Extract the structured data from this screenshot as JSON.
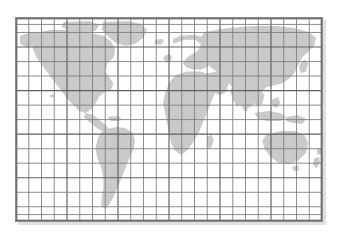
{
  "figure": {
    "kind": "world-map",
    "projection_label": "equirectangular",
    "background_color": "#ffffff",
    "land_color": "#c9cacb",
    "graticule_color": "#7d7f81",
    "graticule_major_color": "#5d5f61",
    "frame_color": "#6f7173",
    "shadow_color": "#c9c9c9",
    "frame": {
      "x": 15,
      "y": 17,
      "width": 308,
      "height": 205
    },
    "graticule": {
      "columns": 24,
      "rows": 14,
      "meridian_spacing_degrees": 15,
      "parallel_spacing_degrees": 15,
      "major_every_columns": 4,
      "major_every_rows": 3,
      "show_grid": true
    },
    "extent": {
      "west_degrees": -180,
      "east_degrees": 180,
      "north_degrees": 84,
      "south_degrees": -126
    },
    "landmasses": [
      {
        "name": "north-america"
      },
      {
        "name": "greenland"
      },
      {
        "name": "south-america"
      },
      {
        "name": "africa"
      },
      {
        "name": "europe"
      },
      {
        "name": "asia"
      },
      {
        "name": "australia"
      },
      {
        "name": "new-zealand"
      },
      {
        "name": "indonesia"
      },
      {
        "name": "japan"
      },
      {
        "name": "british-isles"
      },
      {
        "name": "madagascar"
      },
      {
        "name": "iceland"
      },
      {
        "name": "hawaii"
      },
      {
        "name": "new-guinea"
      },
      {
        "name": "sri-lanka"
      },
      {
        "name": "philippines"
      }
    ],
    "labels": [],
    "legend": null,
    "title": ""
  }
}
